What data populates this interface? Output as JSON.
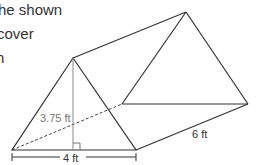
{
  "prompt": {
    "lines": [
      "he shown",
      "cover",
      "h"
    ]
  },
  "diagram": {
    "type": "triangular-prism",
    "labels": {
      "height": "3.75 ft",
      "base": "4 ft",
      "length": "6 ft"
    },
    "colors": {
      "edge": "#333333",
      "altitude": "#888888",
      "height_label": "#777777"
    }
  }
}
